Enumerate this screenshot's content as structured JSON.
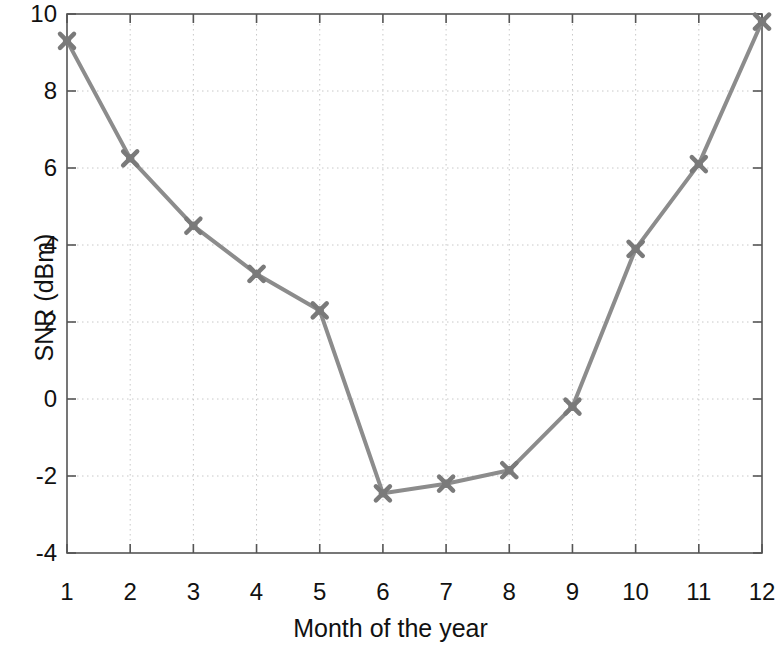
{
  "chart_data": {
    "type": "line",
    "title": "",
    "subtitle": "",
    "xlabel": "Month of the year",
    "ylabel": "SNR (dBm)",
    "x": [
      1,
      2,
      3,
      4,
      5,
      6,
      7,
      8,
      9,
      10,
      11,
      12
    ],
    "categories": [
      "1",
      "2",
      "3",
      "4",
      "5",
      "6",
      "7",
      "8",
      "9",
      "10",
      "11",
      "12"
    ],
    "values": [
      9.3,
      6.25,
      4.5,
      3.25,
      2.3,
      -2.45,
      -2.2,
      -1.85,
      -0.2,
      3.9,
      6.1,
      9.8
    ],
    "series": [
      {
        "name": "SNR",
        "values": [
          9.3,
          6.25,
          4.5,
          3.25,
          2.3,
          -2.45,
          -2.2,
          -1.85,
          -0.2,
          3.9,
          6.1,
          9.8
        ]
      }
    ],
    "xlim": [
      1,
      12
    ],
    "ylim": [
      -4,
      10
    ],
    "xticks": [
      1,
      2,
      3,
      4,
      5,
      6,
      7,
      8,
      9,
      10,
      11,
      12
    ],
    "xtick_labels": [
      "1",
      "2",
      "3",
      "4",
      "5",
      "6",
      "7",
      "8",
      "9",
      "10",
      "11",
      "12"
    ],
    "yticks": [
      -4,
      -2,
      0,
      2,
      4,
      6,
      8,
      10
    ],
    "ytick_labels": [
      "-4",
      "-2",
      "0",
      "2",
      "4",
      "6",
      "8",
      "10"
    ],
    "grid": true,
    "grid_style": "dotted",
    "legend": null,
    "legend_position": "none",
    "annotations": [],
    "colors": {
      "line": "#8c8c8c",
      "marker": "#7a7a7a",
      "grid": "#c8c8c8",
      "axis": "#555555",
      "text": "#111111",
      "background": "#ffffff"
    },
    "marker": "x-cluster",
    "line_width": 4
  }
}
